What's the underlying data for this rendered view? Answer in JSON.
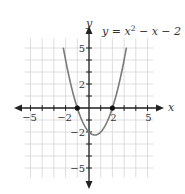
{
  "chart_data": {
    "type": "line",
    "equation": {
      "prefix": "y = x",
      "exponent": "2",
      "suffix": " − x − 2"
    },
    "xlabel": "x",
    "ylabel": "y",
    "xlim": [
      -5.5,
      5.5
    ],
    "ylim": [
      -5.8,
      5.8
    ],
    "grid": true,
    "x_ticks": [
      -5,
      -2,
      2,
      5
    ],
    "x_tick_labels": [
      "−5",
      "−2",
      "2",
      "5"
    ],
    "y_ticks": [
      5,
      2,
      -2,
      -5
    ],
    "y_tick_labels": [
      "5",
      "2",
      "−2",
      "−5"
    ],
    "series": [
      {
        "name": "y = x^2 - x - 2",
        "function": "x^2 - x - 2",
        "color": "#7a7a7a",
        "x": [
          -2.2,
          -2,
          -1.5,
          -1,
          -0.5,
          0,
          0.5,
          1,
          1.5,
          2,
          2.5,
          3,
          3.2
        ],
        "y": [
          4.04,
          4,
          1.75,
          0,
          -1.25,
          -2,
          -2.25,
          -2,
          -1.25,
          0,
          1.75,
          4,
          5.04
        ]
      }
    ],
    "marked_points": [
      {
        "x": -1,
        "y": 0,
        "label": "x-intercept"
      },
      {
        "x": 2,
        "y": 0,
        "label": "x-intercept"
      }
    ]
  },
  "colors": {
    "axis": "#222222",
    "grid": "#d6d6d6",
    "curve": "#7a7a7a",
    "text": "#333333"
  }
}
